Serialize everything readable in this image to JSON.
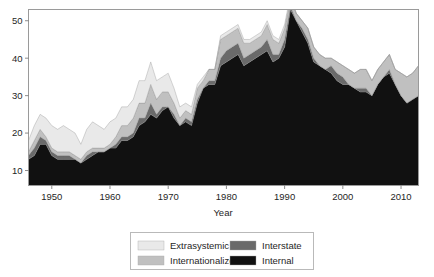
{
  "figure": {
    "kind": "stacked-area-chart"
  },
  "chart_data": {
    "type": "area",
    "stacked": true,
    "title": "",
    "subtitle": "",
    "xlabel": "Year",
    "ylabel": "",
    "xlim": [
      1946,
      2013
    ],
    "ylim": [
      6,
      53
    ],
    "grid": false,
    "legend_position": "bottom-outside",
    "xticks": [
      1950,
      1960,
      1970,
      1980,
      1990,
      2000,
      2010
    ],
    "xtick_labels": [
      "1950",
      "1960",
      "1970",
      "1980",
      "1990",
      "2000",
      "2010"
    ],
    "yticks": [
      10,
      20,
      30,
      40,
      50
    ],
    "ytick_labels": [
      "10",
      "20",
      "30",
      "40",
      "50"
    ],
    "x": [
      1946,
      1947,
      1948,
      1949,
      1950,
      1951,
      1952,
      1953,
      1954,
      1955,
      1956,
      1957,
      1958,
      1959,
      1960,
      1961,
      1962,
      1963,
      1964,
      1965,
      1966,
      1967,
      1968,
      1969,
      1970,
      1971,
      1972,
      1973,
      1974,
      1975,
      1976,
      1977,
      1978,
      1979,
      1980,
      1981,
      1982,
      1983,
      1984,
      1985,
      1986,
      1987,
      1988,
      1989,
      1990,
      1991,
      1992,
      1993,
      1994,
      1995,
      1996,
      1997,
      1998,
      1999,
      2000,
      2001,
      2002,
      2003,
      2004,
      2005,
      2006,
      2007,
      2008,
      2009,
      2010,
      2011,
      2012,
      2013
    ],
    "stack_order_bottom_to_top": [
      "Internal",
      "Interstate",
      "Internationalized",
      "Extrasystemic"
    ],
    "series": [
      {
        "name": "Internal",
        "color": "#111111",
        "values": [
          7,
          8,
          11,
          11,
          8,
          7,
          7,
          7,
          7,
          6,
          7,
          8,
          9,
          9,
          10,
          10,
          12,
          12,
          13,
          16,
          17,
          19,
          18,
          20,
          21,
          18,
          16,
          17,
          16,
          22,
          26,
          27,
          27,
          32,
          33,
          34,
          35,
          32,
          33,
          34,
          35,
          36,
          33,
          34,
          37,
          47,
          44,
          41,
          38,
          33,
          32,
          31,
          30,
          28,
          27,
          27,
          26,
          25,
          25,
          24,
          27,
          29,
          30,
          27,
          24,
          22,
          23,
          24
        ]
      },
      {
        "name": "Interstate",
        "color": "#6a6a6a",
        "values": [
          1,
          2,
          2,
          1,
          1,
          1,
          1,
          1,
          0,
          0,
          1,
          1,
          0,
          0,
          0,
          1,
          1,
          1,
          1,
          2,
          1,
          3,
          1,
          1,
          0,
          1,
          0,
          1,
          1,
          1,
          0,
          1,
          1,
          2,
          3,
          3,
          3,
          2,
          2,
          2,
          2,
          3,
          2,
          1,
          2,
          1,
          0,
          1,
          1,
          1,
          0,
          0,
          2,
          2,
          2,
          0,
          0,
          1,
          1,
          0,
          0,
          0,
          1,
          0,
          0,
          0,
          0,
          0
        ]
      },
      {
        "name": "Internationalized",
        "color": "#c0c0c0",
        "values": [
          1,
          2,
          2,
          1,
          1,
          1,
          1,
          1,
          1,
          1,
          1,
          1,
          1,
          1,
          1,
          2,
          3,
          3,
          4,
          4,
          4,
          5,
          4,
          4,
          4,
          3,
          2,
          2,
          2,
          3,
          2,
          3,
          3,
          5,
          4,
          4,
          4,
          4,
          3,
          3,
          3,
          4,
          4,
          3,
          3,
          2,
          2,
          2,
          3,
          3,
          3,
          3,
          2,
          3,
          3,
          4,
          4,
          5,
          5,
          4,
          4,
          4,
          4,
          4,
          6,
          7,
          7,
          8
        ]
      },
      {
        "name": "Extrasystemic",
        "color": "#e9e9e9",
        "values": [
          3,
          4,
          4,
          5,
          6,
          6,
          7,
          6,
          6,
          4,
          6,
          7,
          6,
          5,
          6,
          5,
          5,
          5,
          5,
          6,
          6,
          6,
          5,
          4,
          5,
          4,
          3,
          2,
          2,
          1,
          1,
          0,
          0,
          1,
          1,
          1,
          1,
          1,
          1,
          1,
          1,
          1,
          1,
          1,
          1,
          1,
          0,
          0,
          0,
          0,
          0,
          0,
          0,
          0,
          0,
          0,
          0,
          0,
          0,
          0,
          0,
          0,
          0,
          0,
          0,
          0,
          0,
          0
        ]
      }
    ],
    "legend_entries": [
      {
        "label": "Extrasystemic",
        "color": "#e9e9e9"
      },
      {
        "label": "Internationalized",
        "color": "#c0c0c0"
      },
      {
        "label": "Interstate",
        "color": "#6a6a6a"
      },
      {
        "label": "Internal",
        "color": "#111111"
      }
    ],
    "peak": {
      "year": 1991,
      "total": 51
    }
  },
  "colors": {
    "frame": "#9a9a9a",
    "text": "#1f1f1f",
    "legend_border": "#b9b9b9",
    "background": "#ffffff"
  }
}
